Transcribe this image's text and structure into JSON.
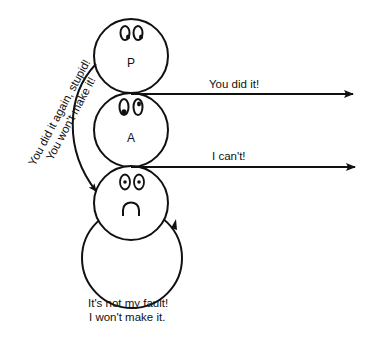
{
  "diagram": {
    "type": "transactional-analysis ego-state diagram",
    "nodes": [
      {
        "id": "parent",
        "letter": "P",
        "expression": "eyes-looking-right"
      },
      {
        "id": "adult",
        "letter": "A",
        "expression": "eyes-looking-right"
      },
      {
        "id": "child",
        "letter": "",
        "expression": "sad-face"
      }
    ],
    "arrows": [
      {
        "from": "parent-adult-junction",
        "to": "right",
        "label": "You did it!"
      },
      {
        "from": "adult-child-junction",
        "to": "right",
        "label": "I can't!"
      },
      {
        "from": "parent",
        "to": "child",
        "label_line1": "You did it again, stupid!",
        "label_line2": "You won't make it!"
      },
      {
        "from": "child",
        "to": "child",
        "kind": "self-loop"
      }
    ],
    "loop_caption": {
      "line1": "It's not my fault!",
      "line2": "I won't make it."
    },
    "colors": {
      "stroke": "#111111",
      "background": "#ffffff"
    }
  }
}
